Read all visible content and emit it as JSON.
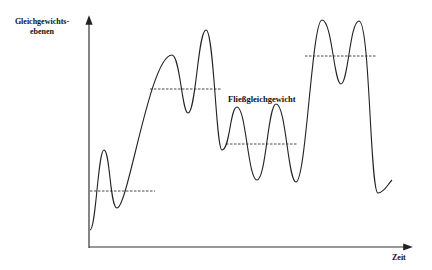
{
  "diagram": {
    "y_axis_label_line1": "Gleichgewichts-",
    "y_axis_label_line2": "ebenen",
    "x_axis_label": "Zeit",
    "annotation": "Fließgleichgewicht",
    "line_color": "#222222",
    "curve_description": "oscillating curve around successive equilibrium levels",
    "equilibrium_levels": [
      {
        "name": "level-1",
        "order": 1
      },
      {
        "name": "level-2",
        "order": 2
      },
      {
        "name": "level-3 (Fließgleichgewicht)",
        "order": 3
      },
      {
        "name": "level-4",
        "order": 4
      }
    ]
  }
}
